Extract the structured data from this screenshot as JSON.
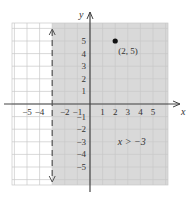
{
  "chart_data": {
    "type": "inequality-graph",
    "title": "",
    "xlabel": "x",
    "ylabel": "y",
    "xlim": [
      -6.5,
      6.5
    ],
    "ylim": [
      -6.5,
      6.5
    ],
    "grid": true,
    "x_ticks": [
      "-5",
      "-4",
      "-2",
      "-1",
      "1",
      "2",
      "3",
      "4",
      "5"
    ],
    "y_ticks": [
      "5",
      "4",
      "3",
      "2",
      "1",
      "-1",
      "-2",
      "-3",
      "-4",
      "-5"
    ],
    "boundary": {
      "type": "vertical-line",
      "x": -3,
      "style": "dashed"
    },
    "shaded_region": "x > -3",
    "inequality_label": "x > −3",
    "points": [
      {
        "x": 2,
        "y": 5,
        "label": "(2, 5)"
      }
    ],
    "colors": {
      "shade": "#d9d9d9",
      "grid": "#c8c8c8",
      "axis": "#444444"
    }
  }
}
